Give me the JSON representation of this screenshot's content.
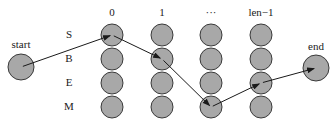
{
  "diagram": {
    "type": "viterbi-lattice",
    "colors": {
      "node_fill": "#a8a8a8",
      "node_stroke": "#3a3a3a",
      "edge": "#1a1a1a",
      "text": "#1a1a1a",
      "background": "#ffffff"
    },
    "start": {
      "label": "start",
      "x": 21,
      "y": 67,
      "r": 13
    },
    "end": {
      "label": "end",
      "x": 316,
      "y": 68,
      "r": 13
    },
    "row_labels": [
      {
        "label": "S",
        "y": 35
      },
      {
        "label": "B",
        "y": 59
      },
      {
        "label": "E",
        "y": 83
      },
      {
        "label": "M",
        "y": 107
      }
    ],
    "row_label_x": 69,
    "columns": [
      {
        "label": "0",
        "x": 112
      },
      {
        "label": "1",
        "x": 162
      },
      {
        "label": "···",
        "x": 211
      },
      {
        "label": "len−1",
        "x": 261
      }
    ],
    "column_label_y": 13,
    "node_radius": 11,
    "path": [
      {
        "from": "start",
        "to": "S@0"
      },
      {
        "from": "S@0",
        "to": "B@1"
      },
      {
        "from": "B@1",
        "to": "M@···"
      },
      {
        "from": "M@···",
        "to": "E@len−1"
      },
      {
        "from": "E@len−1",
        "to": "end"
      }
    ]
  }
}
